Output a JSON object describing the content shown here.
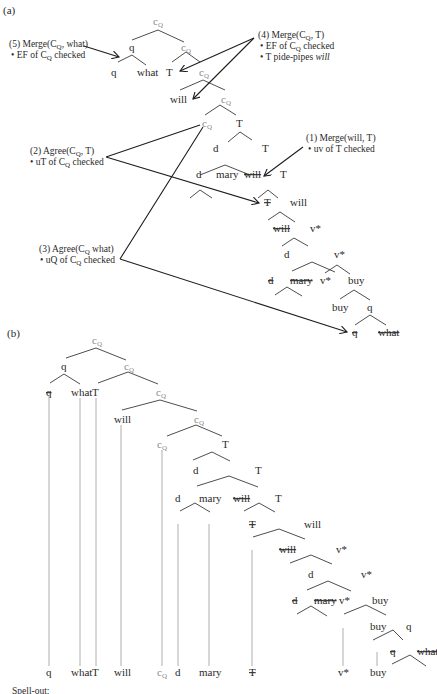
{
  "panel_a": {
    "label": "(a)",
    "annotations": [
      {
        "id": "5",
        "title": "(5) Merge(C",
        "title_sub": "Q",
        "title_rest": ", what)",
        "bullets": [
          "EF of C_Q checked"
        ]
      },
      {
        "id": "4",
        "title": "(4) Merge(C",
        "title_sub": "Q",
        "title_rest": ", T)",
        "bullets": [
          "EF of C_Q checked",
          "T pide-pipes will"
        ]
      },
      {
        "id": "2",
        "title": "(2) Agree(C",
        "title_sub": "Q",
        "title_rest": ", T)",
        "bullets": [
          "uT of C_Q checked"
        ]
      },
      {
        "id": "1",
        "title": "(1) Merge(will, T)",
        "bullets": [
          "uv of T checked"
        ]
      },
      {
        "id": "3",
        "title": "(3) Agree(C",
        "title_sub": "Q",
        "title_rest": " what)",
        "bullets": [
          "uQ of C_Q checked"
        ]
      }
    ],
    "bullet_parts": {
      "ef_pre": "EF of C",
      "ef_post": " checked",
      "ut_pre": "uT of C",
      "ut_post": " checked",
      "uq_pre": "uQ of C",
      "uq_post": " checked",
      "uv": "uv of T checked",
      "pied_pre": "T pide-pipes ",
      "pied_word": "will",
      "sub_q": "Q"
    },
    "nodes": {
      "c": "c",
      "q": "q",
      "what": "what",
      "T": "T",
      "will": "will",
      "d": "d",
      "mary": "mary",
      "vstar": "v*",
      "buy": "buy",
      "sub": "Q"
    }
  },
  "panel_b": {
    "label": "(b)",
    "spellout_label": "Spell-out:",
    "bottom_row": [
      "q",
      "what",
      "T",
      "will",
      "c_Q",
      "d",
      "mary",
      "T(struck)",
      "v*",
      "buy"
    ]
  }
}
